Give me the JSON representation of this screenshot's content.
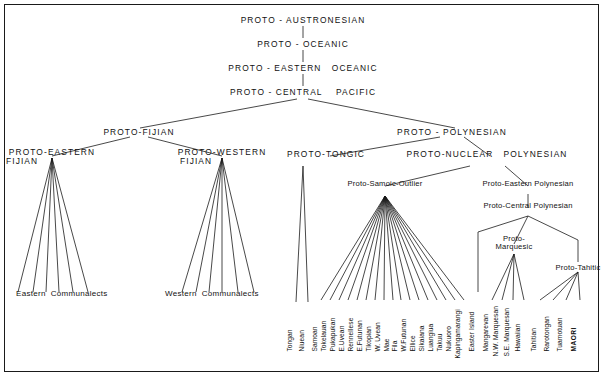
{
  "nodes": {
    "proto_austronesian": "PROTO - AUSTRONESIAN",
    "proto_oceanic": "PROTO - OCEANIC",
    "proto_eastern_oceanic": "PROTO - EASTERN   OCEANIC",
    "proto_central_pacific": "PROTO - CENTRAL    PACIFIC",
    "proto_fijian": "PROTO-FIJIAN",
    "proto_polynesian": "PROTO - POLYNESIAN",
    "proto_eastern_fijian_l1": "PROTO-EASTERN",
    "proto_eastern_fijian_l2": "FIJIAN",
    "proto_western_fijian_l1": "PROTO-WESTERN",
    "proto_western_fijian_l2": "FIJIAN",
    "proto_tongic": "PROTO-TONGIC",
    "proto_nuclear_polynesian": "PROTO-NUCLEAR   POLYNESIAN",
    "proto_samoic_outlier": "Proto-Samoic-Outlier",
    "proto_eastern_polynesian": "Proto-Eastern Polynesian",
    "proto_central_polynesian": "Proto-Central Polynesian",
    "proto_marquesic_l1": "Proto-",
    "proto_marquesic_l2": "Marquesic",
    "proto_tahitic": "Proto-Tahitic",
    "eastern_communalects": "Eastern  Communalects",
    "western_communalects": "Western  Communalects"
  },
  "leaves": {
    "tongic": [
      "Tongan",
      "Niuean"
    ],
    "samoic_outlier": [
      "Samoan",
      "Tokelauan",
      "Pukapukan",
      "E.Uvean",
      "Rennellese",
      "E.Futunan",
      "Tikopian",
      "W. Uvean",
      "Mae",
      "Fila",
      "W.Futunan",
      "Ellice",
      "Sikaiana",
      "Luangiua",
      "Takuu",
      "Nukuoro",
      "Kapingamarangi"
    ],
    "central_polynesian_direct": [
      "Easter Island"
    ],
    "marquesic": [
      "Mangarevan",
      "N.W. Marquesan",
      "S.E. Marquesan",
      "Hawaiian"
    ],
    "tahitic": [
      "Tahitian",
      "Rarotongan",
      "Tuamotuan",
      "MAORI"
    ]
  },
  "colors": {
    "ink": "#1a1a1a",
    "background": "#ffffff"
  }
}
